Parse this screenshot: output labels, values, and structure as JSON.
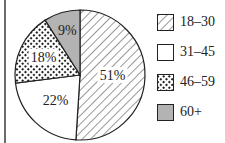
{
  "chart_data": {
    "type": "pie",
    "title": "",
    "categories": [
      "18–30",
      "31–45",
      "46–59",
      "60+"
    ],
    "values": [
      51,
      22,
      18,
      9
    ],
    "labels": [
      "51%",
      "22%",
      "18%",
      "9%"
    ],
    "fills": [
      "diagonal-hatch",
      "white",
      "dotted",
      "gray"
    ],
    "colors": [
      "#ffffff",
      "#ffffff",
      "#ffffff",
      "#b3b3b3"
    ],
    "start_angle": "top (12 o'clock)",
    "direction": "clockwise",
    "legend_position": "right"
  },
  "legend": {
    "items": [
      {
        "label": "18–30"
      },
      {
        "label": "31–45"
      },
      {
        "label": "46–59"
      },
      {
        "label": "60+"
      }
    ]
  }
}
